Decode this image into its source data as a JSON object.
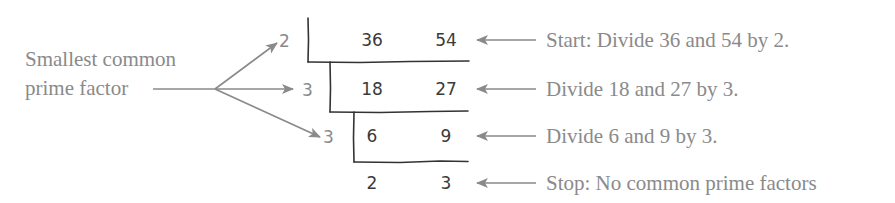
{
  "diagram": {
    "type": "ladder-division",
    "left_label": {
      "line1": "Smallest common",
      "line2": "prime factor"
    },
    "divisors": [
      "2",
      "3",
      "3"
    ],
    "rows": [
      {
        "a": "36",
        "b": "54",
        "note": "Start: Divide 36 and 54 by 2."
      },
      {
        "a": "18",
        "b": "27",
        "note": "Divide 18 and 27 by 3."
      },
      {
        "a": "6",
        "b": "9",
        "note": "Divide 6 and 9 by 3."
      },
      {
        "a": "2",
        "b": "3",
        "note": "Stop: No common prime factors"
      }
    ],
    "colors": {
      "annotation": "#8a8a8a",
      "ink": "#3a3a3a",
      "background": "#ffffff"
    }
  }
}
